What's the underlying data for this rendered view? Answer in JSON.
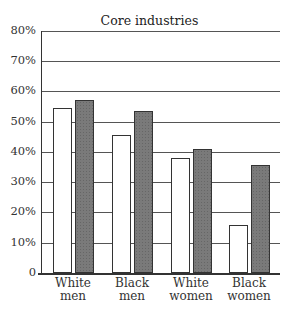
{
  "chart_data": {
    "type": "bar",
    "title": "Core industries",
    "xlabel": "",
    "ylabel": "",
    "ylim": [
      0,
      80
    ],
    "grid": true,
    "yticks": [
      "0",
      "10%",
      "20%",
      "30%",
      "40%",
      "50%",
      "60%",
      "70%",
      "80%"
    ],
    "categories": [
      "White men",
      "Black men",
      "White women",
      "Black women"
    ],
    "category_lines": [
      [
        "White",
        "men"
      ],
      [
        "Black",
        "men"
      ],
      [
        "White",
        "women"
      ],
      [
        "Black",
        "women"
      ]
    ],
    "series": [
      {
        "name": "Series 1 (open)",
        "style": "open",
        "values": [
          54.5,
          45.5,
          38,
          16
        ]
      },
      {
        "name": "Series 2 (shaded)",
        "style": "shaded",
        "values": [
          57,
          53.5,
          41,
          35.5
        ]
      }
    ],
    "legend": null
  }
}
